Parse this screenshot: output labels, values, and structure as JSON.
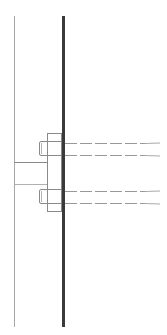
{
  "diagram": {
    "type": "bolted-connection-section",
    "colors": {
      "background": "#ffffff",
      "thin_line": "#9a9a9a",
      "plate": "#3a3a3a",
      "outline": "#8a8a8a",
      "bolt": "#999999"
    },
    "column_line": {
      "x": 14,
      "y1": 16,
      "y2": 327
    },
    "plate": {
      "x": 62,
      "y1": 16,
      "y2": 327,
      "width": 3
    },
    "end_plate": {
      "x": 47,
      "y": 133,
      "width": 15,
      "height": 78
    },
    "stub": {
      "x1": 14,
      "x2": 47,
      "y_top": 162,
      "y_bottom": 184
    },
    "bolts": [
      {
        "head_y": 142,
        "shank_top": 142,
        "shank_bottom": 155
      },
      {
        "head_y": 190,
        "shank_top": 190,
        "shank_bottom": 203
      }
    ]
  }
}
